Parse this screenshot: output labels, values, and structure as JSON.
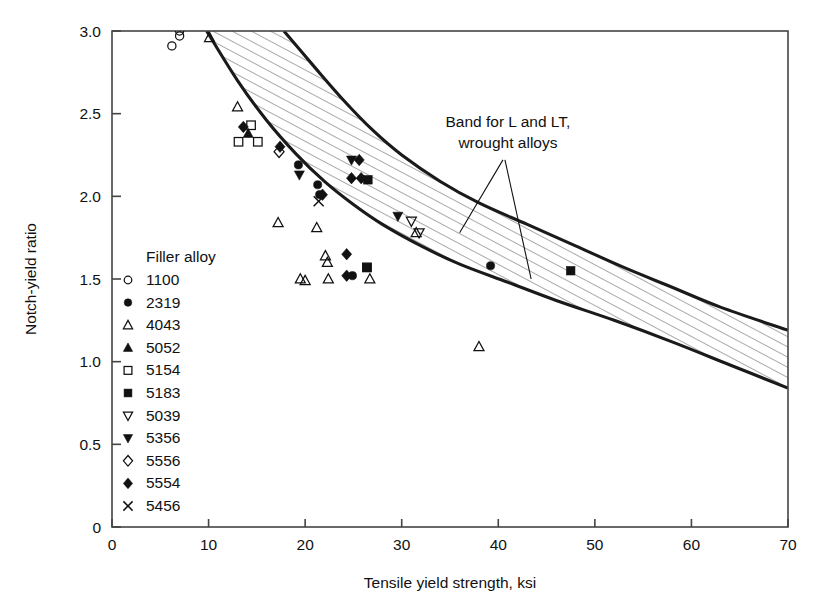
{
  "chart_data": {
    "type": "scatter",
    "title": "",
    "xlabel": "Tensile yield strength, ksi",
    "ylabel": "Notch-yield ratio",
    "xlim": [
      0,
      70
    ],
    "ylim": [
      0,
      3.0
    ],
    "xticks": [
      "0",
      "10",
      "20",
      "30",
      "40",
      "50",
      "60",
      "70"
    ],
    "xtick_values": [
      0,
      10,
      20,
      30,
      40,
      50,
      60,
      70
    ],
    "yticks": [
      "0",
      "0.5",
      "1.0",
      "1.5",
      "2.0",
      "2.5",
      "3.0"
    ],
    "ytick_values": [
      0,
      0.5,
      1.0,
      1.5,
      2.0,
      2.5,
      3.0
    ],
    "grid": false,
    "legend_position": "inside-lower-left",
    "legend_title": "Filler alloy",
    "annotations": [
      {
        "text_line1": "Band for L and LT,",
        "text_line2": "wrought alloys",
        "x": 41.0,
        "y": 2.42
      }
    ],
    "band": {
      "label": "Band for L and LT, wrought alloys",
      "fill": "hatched",
      "upper": [
        [
          17.8,
          3.0
        ],
        [
          21.0,
          2.78
        ],
        [
          24.0,
          2.58
        ],
        [
          27.0,
          2.4
        ],
        [
          30.0,
          2.25
        ],
        [
          34.0,
          2.09
        ],
        [
          38.0,
          1.96
        ],
        [
          43.0,
          1.83
        ],
        [
          48.0,
          1.7
        ],
        [
          53.0,
          1.57
        ],
        [
          58.0,
          1.45
        ],
        [
          63.0,
          1.33
        ],
        [
          70.0,
          1.19
        ]
      ],
      "lower": [
        [
          9.8,
          3.0
        ],
        [
          13.0,
          2.7
        ],
        [
          16.0,
          2.46
        ],
        [
          19.0,
          2.26
        ],
        [
          22.0,
          2.09
        ],
        [
          25.0,
          1.95
        ],
        [
          28.0,
          1.83
        ],
        [
          32.0,
          1.7
        ],
        [
          36.0,
          1.59
        ],
        [
          41.0,
          1.48
        ],
        [
          46.0,
          1.37
        ],
        [
          52.0,
          1.25
        ],
        [
          58.0,
          1.12
        ],
        [
          64.0,
          0.98
        ],
        [
          70.0,
          0.84
        ]
      ]
    },
    "series": [
      {
        "name": "1100",
        "marker": "open-circle",
        "points": [
          [
            6.2,
            2.91
          ],
          [
            7.0,
            2.97
          ],
          [
            7.0,
            3.0
          ]
        ]
      },
      {
        "name": "2319",
        "marker": "filled-circle",
        "points": [
          [
            19.3,
            2.19
          ],
          [
            21.3,
            2.07
          ],
          [
            21.5,
            2.01
          ],
          [
            24.9,
            1.52
          ],
          [
            39.2,
            1.58
          ]
        ]
      },
      {
        "name": "4043",
        "marker": "open-triangle-up",
        "points": [
          [
            10.1,
            2.96
          ],
          [
            13.0,
            2.54
          ],
          [
            17.2,
            1.84
          ],
          [
            19.5,
            1.5
          ],
          [
            20.0,
            1.49
          ],
          [
            21.2,
            1.81
          ],
          [
            22.1,
            1.64
          ],
          [
            22.3,
            1.6
          ],
          [
            22.4,
            1.5
          ],
          [
            26.7,
            1.5
          ],
          [
            38.0,
            1.09
          ],
          [
            31.5,
            1.78
          ]
        ]
      },
      {
        "name": "5052",
        "marker": "filled-triangle-up",
        "points": [
          [
            14.1,
            2.38
          ]
        ]
      },
      {
        "name": "5154",
        "marker": "open-square",
        "points": [
          [
            13.1,
            2.33
          ],
          [
            14.4,
            2.43
          ],
          [
            15.1,
            2.33
          ],
          [
            26.4,
            1.57
          ]
        ]
      },
      {
        "name": "5183",
        "marker": "filled-square",
        "points": [
          [
            26.5,
            2.1
          ],
          [
            26.4,
            1.57
          ],
          [
            47.5,
            1.55
          ]
        ]
      },
      {
        "name": "5039",
        "marker": "open-triangle-down",
        "points": [
          [
            31.0,
            1.85
          ],
          [
            31.8,
            1.78
          ]
        ]
      },
      {
        "name": "5356",
        "marker": "filled-triangle-down",
        "points": [
          [
            19.4,
            2.13
          ],
          [
            24.8,
            2.22
          ],
          [
            29.6,
            1.88
          ]
        ]
      },
      {
        "name": "5556",
        "marker": "open-diamond",
        "points": [
          [
            17.3,
            2.27
          ]
        ]
      },
      {
        "name": "5554",
        "marker": "filled-diamond",
        "points": [
          [
            13.6,
            2.42
          ],
          [
            17.4,
            2.3
          ],
          [
            21.8,
            2.01
          ],
          [
            25.6,
            2.22
          ],
          [
            24.8,
            2.11
          ],
          [
            25.8,
            2.11
          ],
          [
            24.3,
            1.65
          ],
          [
            24.3,
            1.52
          ]
        ]
      },
      {
        "name": "5456",
        "marker": "cross-x",
        "points": [
          [
            21.4,
            1.97
          ]
        ]
      }
    ]
  },
  "legend": {
    "title": "Filler alloy",
    "entries": [
      {
        "label": "1100",
        "marker": "open-circle"
      },
      {
        "label": "2319",
        "marker": "filled-circle"
      },
      {
        "label": "4043",
        "marker": "open-triangle-up"
      },
      {
        "label": "5052",
        "marker": "filled-triangle-up"
      },
      {
        "label": "5154",
        "marker": "open-square"
      },
      {
        "label": "5183",
        "marker": "filled-square"
      },
      {
        "label": "5039",
        "marker": "open-triangle-down"
      },
      {
        "label": "5356",
        "marker": "filled-triangle-down"
      },
      {
        "label": "5556",
        "marker": "open-diamond"
      },
      {
        "label": "5554",
        "marker": "filled-diamond"
      },
      {
        "label": "5456",
        "marker": "cross-x"
      }
    ]
  },
  "colors": {
    "ink": "#111111",
    "axis": "#444444",
    "band_stroke": "#1a1a1a",
    "hatch": "#6a6a6a",
    "background": "#ffffff"
  }
}
